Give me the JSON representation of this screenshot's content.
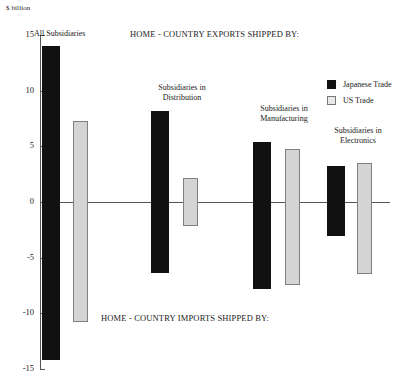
{
  "chart_data": {
    "type": "bar",
    "title": "",
    "top_title": "HOME - COUNTRY EXPORTS SHIPPED BY:",
    "bottom_title": "HOME - COUNTRY IMPORTS SHIPPED BY:",
    "ylabel": "$ billion",
    "xlabel": "",
    "ylim": [
      -15,
      15
    ],
    "grid": false,
    "legend_position": "upper-right",
    "tick_labels": [
      "15",
      "10",
      "5",
      "0",
      "-5",
      "-10",
      "-15"
    ],
    "tick_values": [
      15,
      10,
      5,
      0,
      -5,
      -10,
      -15
    ],
    "categories": [
      "All Subsidiaries",
      "Subsidiaries in\nDistribution",
      "Subsidiaries in\nManufacturing",
      "Subsidiaries in\nElectronics"
    ],
    "series": [
      {
        "name": "Japanese Trade",
        "color": "#111111",
        "exports": [
          14.0,
          8.2,
          5.4,
          3.2
        ],
        "imports": [
          -14.2,
          -6.4,
          -7.8,
          -3.1
        ]
      },
      {
        "name": "US Trade",
        "color": "#d4d4d4",
        "exports": [
          7.3,
          2.2,
          4.8,
          3.5
        ],
        "imports": [
          -10.8,
          -2.2,
          -7.5,
          -6.5
        ]
      }
    ]
  },
  "legend": {
    "items": [
      {
        "label": "Japanese Trade"
      },
      {
        "label": "US Trade"
      }
    ]
  },
  "axis": {
    "unit_label": "$ billion"
  },
  "groups": [
    {
      "caption": "All Subsidiaries"
    },
    {
      "caption": "Subsidiaries in\nDistribution"
    },
    {
      "caption": "Subsidiaries in\nManufacturing"
    },
    {
      "caption": "Subsidiaries in\nElectronics"
    }
  ],
  "titles": {
    "top": "HOME - COUNTRY EXPORTS SHIPPED BY:",
    "bottom": "HOME - COUNTRY IMPORTS SHIPPED BY:"
  }
}
